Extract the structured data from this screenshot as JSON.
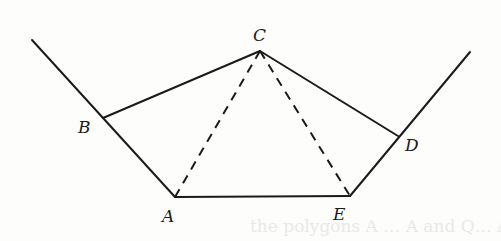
{
  "figure": {
    "colors": {
      "stroke": "#1a1a1a",
      "background": "#fdfdfc",
      "bleed_text": "#dcdcda"
    },
    "vertices": {
      "A": {
        "label": "A",
        "x": 175,
        "y": 197
      },
      "B": {
        "label": "B",
        "x": 103,
        "y": 118
      },
      "C": {
        "label": "C",
        "x": 260,
        "y": 51
      },
      "D": {
        "label": "D",
        "x": 398,
        "y": 136
      },
      "E": {
        "label": "E",
        "x": 350,
        "y": 196
      }
    },
    "labels": {
      "A": {
        "text": "A",
        "x": 162,
        "y": 222
      },
      "B": {
        "text": "B",
        "x": 78,
        "y": 133
      },
      "C": {
        "text": "C",
        "x": 253,
        "y": 41
      },
      "D": {
        "text": "D",
        "x": 405,
        "y": 151
      },
      "E": {
        "text": "E",
        "x": 333,
        "y": 220
      }
    },
    "solid_segments": [
      {
        "from": "ray-left-start",
        "to": "A",
        "x1": 32,
        "y1": 40,
        "x2": 175,
        "y2": 197
      },
      {
        "from": "B",
        "to": "C",
        "x1": 103,
        "y1": 118,
        "x2": 260,
        "y2": 51
      },
      {
        "from": "C",
        "to": "D",
        "x1": 260,
        "y1": 51,
        "x2": 398,
        "y2": 136
      },
      {
        "from": "A",
        "to": "E",
        "x1": 175,
        "y1": 197,
        "x2": 350,
        "y2": 196
      },
      {
        "from": "E",
        "to": "ray-right-end",
        "x1": 350,
        "y1": 196,
        "x2": 470,
        "y2": 52
      }
    ],
    "dashed_segments": [
      {
        "from": "C",
        "to": "A",
        "x1": 260,
        "y1": 51,
        "x2": 175,
        "y2": 197
      },
      {
        "from": "C",
        "to": "E",
        "x1": 260,
        "y1": 51,
        "x2": 350,
        "y2": 196
      }
    ],
    "bleed_through_text": "the polygons A … A and Q… A, which in"
  }
}
